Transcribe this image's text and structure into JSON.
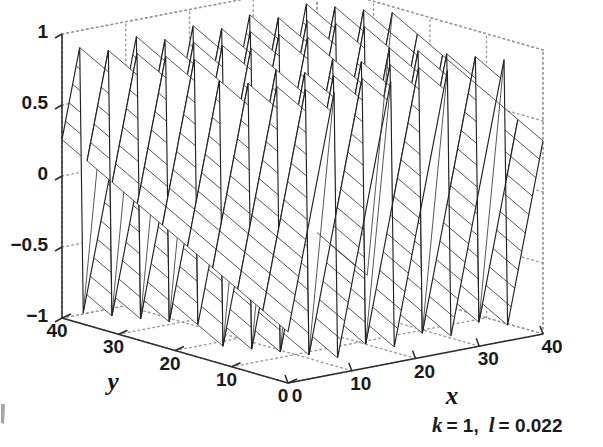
{
  "figure": {
    "kind": "3d-mesh-surface-plot",
    "background_color": "#ffffff",
    "line_color": "#333333",
    "grid_color": "#9a9a9a"
  },
  "annotation": {
    "text": "k = 1,  l = 0.022",
    "k_symbol": "k",
    "k_value": "= 1,",
    "l_symbol": "l",
    "l_value": "= 0.022"
  },
  "axes": {
    "x": {
      "name": "x",
      "ticks": [
        0,
        10,
        20,
        30,
        40
      ],
      "tick_labels": [
        "0",
        "10",
        "20",
        "30",
        "40"
      ],
      "range": [
        0,
        40
      ]
    },
    "y": {
      "name": "y",
      "ticks": [
        0,
        10,
        20,
        30,
        40
      ],
      "tick_labels": [
        "40",
        "30",
        "20",
        "10",
        "0"
      ],
      "tick_values_left_to_right": [
        40,
        30,
        20,
        10,
        0
      ],
      "range": [
        0,
        40
      ]
    },
    "z": {
      "name": "",
      "ticks": [
        1,
        0.5,
        0,
        -0.5,
        -1
      ],
      "tick_labels": [
        "1",
        "0.5",
        "0",
        "−0.5",
        "−1"
      ],
      "range": [
        -1,
        1
      ]
    }
  },
  "chart_data": {
    "type": "line",
    "title": "",
    "subtitle": "",
    "xlabel": "x",
    "ylabel": "y",
    "zlabel": "",
    "surface_kind": "sawtooth traveling wave",
    "parameters": {
      "k": 1,
      "l": 0.022
    },
    "wave_periods_along_x": 4.5,
    "mesh": {
      "nx": 72,
      "ny": 9
    },
    "xlim": [
      0,
      40
    ],
    "ylim": [
      0,
      40
    ],
    "zlim": [
      -1,
      1
    ],
    "grid": true,
    "legend": "none",
    "view": {
      "azimuth": -37.5,
      "elevation": 30
    },
    "x": [
      0,
      5,
      10,
      15,
      20,
      25,
      30,
      35,
      40
    ],
    "y": [
      0,
      5,
      10,
      15,
      20,
      25,
      30,
      35,
      40
    ],
    "series": [
      {
        "name": "z at y=0",
        "values": [
          0.0,
          0.12,
          -0.88,
          0.6,
          -0.44,
          -0.2,
          0.92,
          -0.74,
          0.32
        ]
      },
      {
        "name": "z at y=20",
        "values": [
          0.36,
          0.48,
          -0.62,
          0.88,
          -0.1,
          0.15,
          0.72,
          -0.95,
          0.6
        ]
      },
      {
        "name": "z at y=40",
        "values": [
          0.7,
          0.82,
          -0.3,
          0.98,
          0.24,
          0.5,
          0.4,
          -0.7,
          0.88
        ]
      }
    ]
  }
}
